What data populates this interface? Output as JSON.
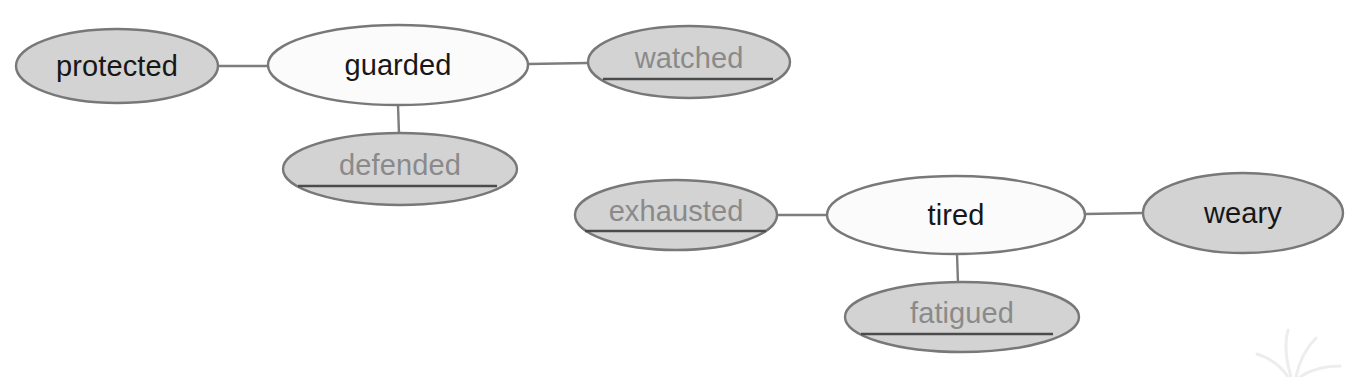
{
  "diagram": {
    "type": "word-web",
    "title": "",
    "background_color": "#ffffff",
    "fill_shaded": "#d3d3d3",
    "fill_plain": "#fbfbfb",
    "stroke_color": "#787878",
    "text_known_color": "#171717",
    "text_answer_color": "#8a8a8a",
    "answer_line_color": "#4b4b4b",
    "connector_color": "#7d7d7d",
    "clusters": [
      {
        "id": "cluster-guarded",
        "center_word": "guarded",
        "synonyms": [
          "protected",
          "watched",
          "defended"
        ]
      },
      {
        "id": "cluster-tired",
        "center_word": "tired",
        "synonyms": [
          "exhausted",
          "weary",
          "fatigued"
        ]
      }
    ],
    "nodes": [
      {
        "id": "protected",
        "label": "protected",
        "cluster": "cluster-guarded",
        "role": "synonym",
        "shaded": true,
        "answer_line": false,
        "text_style": "known",
        "cx": 117,
        "cy": 66,
        "rx": 101,
        "ry": 37
      },
      {
        "id": "guarded",
        "label": "guarded",
        "cluster": "cluster-guarded",
        "role": "center",
        "shaded": false,
        "answer_line": false,
        "text_style": "known",
        "cx": 398,
        "cy": 65,
        "rx": 130,
        "ry": 40
      },
      {
        "id": "watched",
        "label": "watched",
        "cluster": "cluster-guarded",
        "role": "synonym",
        "shaded": true,
        "answer_line": true,
        "text_style": "answer",
        "cx": 689,
        "cy": 62,
        "rx": 101,
        "ry": 36,
        "line_x1": 603,
        "line_x2": 773,
        "line_y": 79
      },
      {
        "id": "defended",
        "label": "defended",
        "cluster": "cluster-guarded",
        "role": "synonym",
        "shaded": true,
        "answer_line": true,
        "text_style": "answer",
        "cx": 400,
        "cy": 169,
        "rx": 117,
        "ry": 36,
        "line_x1": 298,
        "line_x2": 497,
        "line_y": 186
      },
      {
        "id": "exhausted",
        "label": "exhausted",
        "cluster": "cluster-tired",
        "role": "synonym",
        "shaded": true,
        "answer_line": true,
        "text_style": "answer",
        "cx": 676,
        "cy": 215,
        "rx": 101,
        "ry": 35,
        "line_x1": 585,
        "line_x2": 766,
        "line_y": 231
      },
      {
        "id": "tired",
        "label": "tired",
        "cluster": "cluster-tired",
        "role": "center",
        "shaded": false,
        "answer_line": false,
        "text_style": "known",
        "cx": 956,
        "cy": 215,
        "rx": 129,
        "ry": 39
      },
      {
        "id": "weary",
        "label": "weary",
        "cluster": "cluster-tired",
        "role": "synonym",
        "shaded": true,
        "answer_line": false,
        "text_style": "known",
        "cx": 1243,
        "cy": 213,
        "rx": 100,
        "ry": 40
      },
      {
        "id": "fatigued",
        "label": "fatigued",
        "cluster": "cluster-tired",
        "role": "synonym",
        "shaded": true,
        "answer_line": true,
        "text_style": "answer",
        "cx": 962,
        "cy": 317,
        "rx": 117,
        "ry": 35,
        "line_x1": 861,
        "line_x2": 1053,
        "line_y": 334
      }
    ],
    "edges": [
      {
        "id": "edge-protected-guarded",
        "from": "protected",
        "to": "guarded",
        "x1": 218,
        "y1": 66,
        "x2": 268,
        "y2": 66
      },
      {
        "id": "edge-guarded-watched",
        "from": "guarded",
        "to": "watched",
        "x1": 528,
        "y1": 64,
        "x2": 588,
        "y2": 63
      },
      {
        "id": "edge-guarded-defended",
        "from": "guarded",
        "to": "defended",
        "x1": 398,
        "y1": 105,
        "x2": 399,
        "y2": 134
      },
      {
        "id": "edge-exhausted-tired",
        "from": "exhausted",
        "to": "tired",
        "x1": 777,
        "y1": 215,
        "x2": 827,
        "y2": 215
      },
      {
        "id": "edge-tired-weary",
        "from": "tired",
        "to": "weary",
        "x1": 1085,
        "y1": 214,
        "x2": 1143,
        "y2": 213
      },
      {
        "id": "edge-tired-fatigued",
        "from": "tired",
        "to": "fatigued",
        "x1": 957,
        "y1": 254,
        "x2": 958,
        "y2": 283
      }
    ]
  }
}
